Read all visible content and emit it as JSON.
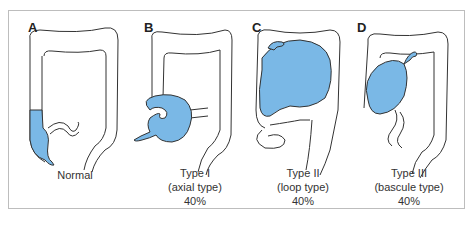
{
  "figure": {
    "colors": {
      "contrast_fill": "#7ab8e6",
      "outline": "#333333",
      "frame": "#bdbdbd"
    },
    "panels": [
      {
        "letter": "A",
        "caption": [
          "Normal"
        ]
      },
      {
        "letter": "B",
        "caption": [
          "Type I",
          "(axial type)",
          "40%"
        ]
      },
      {
        "letter": "C",
        "caption": [
          "Type II",
          "(loop type)",
          "40%"
        ]
      },
      {
        "letter": "D",
        "caption": [
          "Type III",
          "(bascule type)",
          "40%"
        ]
      }
    ]
  }
}
